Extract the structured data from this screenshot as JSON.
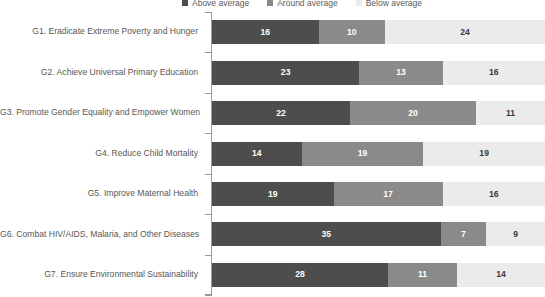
{
  "chart_data": {
    "type": "bar",
    "subtype": "stacked-horizontal",
    "title": "",
    "xlabel": "",
    "ylabel": "",
    "grid": false,
    "legend_position": "top",
    "orientation": "horizontal",
    "stacked": true,
    "categories": [
      "G1. Eradicate Extreme Poverty and Hunger",
      "G2. Achieve Universal Primary Education",
      "G3. Promote Gender Equality and Empower Women",
      "G4. Reduce Child Mortality",
      "G5. Improve Maternal Health",
      "G6. Combat HIV/AIDS, Malaria, and Other Diseases",
      "G7. Ensure Environmental Sustainability"
    ],
    "series": [
      {
        "name": "Above average",
        "color": "#4d4d4d",
        "label_color": "#ffffff",
        "values": [
          16,
          23,
          22,
          14,
          19,
          35,
          28
        ]
      },
      {
        "name": "Around average",
        "color": "#8a8a8a",
        "label_color": "#ffffff",
        "values": [
          10,
          13,
          20,
          19,
          17,
          7,
          11
        ]
      },
      {
        "name": "Below average",
        "color": "#ebebeb",
        "label_color": "#3a3a3a",
        "values": [
          24,
          16,
          11,
          19,
          16,
          9,
          14
        ]
      }
    ],
    "row_totals": [
      50,
      52,
      53,
      52,
      52,
      51,
      53
    ]
  },
  "legend": {
    "items": [
      {
        "label": "Above average",
        "color": "#4d4d4d"
      },
      {
        "label": "Around average",
        "color": "#8a8a8a"
      },
      {
        "label": "Below average",
        "color": "#ebebeb"
      }
    ]
  },
  "axis": {
    "line_color": "#9a9a9a"
  }
}
